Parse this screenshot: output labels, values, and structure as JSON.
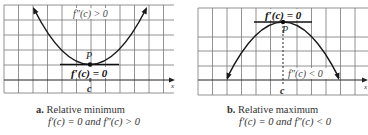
{
  "figures": [
    {
      "id": "a",
      "caption_letter": "a.",
      "caption_title": "Relative minimum",
      "caption_condition": "f′(c) = 0 and f″(c) > 0",
      "curve_type": "concave-up",
      "label_top": "f″(c) > 0",
      "label_point": "P",
      "label_tangent": "f′(c) = 0",
      "label_c": "c",
      "label_axis": "x"
    },
    {
      "id": "b",
      "caption_letter": "b.",
      "caption_title": "Relative maximum",
      "caption_condition": "f′(c) = 0 and f″(c) < 0",
      "curve_type": "concave-down",
      "label_top": "f′(c) = 0",
      "label_point": "P",
      "label_tangent": "f″(c) < 0",
      "label_c": "c",
      "label_axis": "x"
    }
  ],
  "colors": {
    "grid": "#6b6b6b",
    "curve": "#1a1a1a",
    "text": "#222222",
    "background": "#ffffff"
  }
}
